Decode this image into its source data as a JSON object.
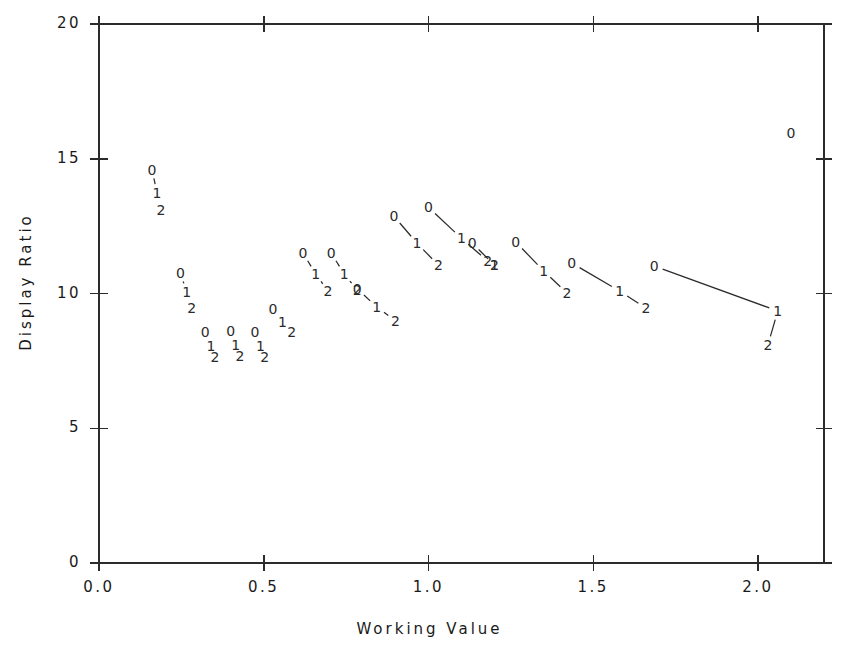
{
  "chart_data": {
    "type": "line",
    "title": "",
    "xlabel": "Working Value",
    "ylabel": "Display Ratio",
    "xlim": [
      0.0,
      2.2
    ],
    "ylim": [
      0,
      20
    ],
    "grid": false,
    "legend": "none",
    "point_labels": [
      "0",
      "1",
      "2"
    ],
    "xticks": [
      {
        "value": 0.0,
        "label": "0.0"
      },
      {
        "value": 0.5,
        "label": "0.5"
      },
      {
        "value": 1.0,
        "label": "1.0"
      },
      {
        "value": 1.5,
        "label": "1.5"
      },
      {
        "value": 2.0,
        "label": "2.0"
      }
    ],
    "yticks": [
      {
        "value": 0,
        "label": "0"
      },
      {
        "value": 5,
        "label": "5"
      },
      {
        "value": 10,
        "label": "10"
      },
      {
        "value": 15,
        "label": "15"
      },
      {
        "value": 20,
        "label": "20"
      }
    ],
    "series": [
      {
        "name": "group-1",
        "points": [
          {
            "label": "0",
            "x": 0.161,
            "y": 14.6
          },
          {
            "label": "1",
            "x": 0.176,
            "y": 13.73
          },
          {
            "label": "2",
            "x": 0.188,
            "y": 13.09
          }
        ]
      },
      {
        "name": "group-2",
        "points": [
          {
            "label": "0",
            "x": 0.247,
            "y": 10.76
          },
          {
            "label": "1",
            "x": 0.266,
            "y": 10.06
          },
          {
            "label": "2",
            "x": 0.281,
            "y": 9.46
          }
        ]
      },
      {
        "name": "group-3",
        "points": [
          {
            "label": "0",
            "x": 0.322,
            "y": 8.57
          },
          {
            "label": "1",
            "x": 0.34,
            "y": 8.05
          },
          {
            "label": "2",
            "x": 0.352,
            "y": 7.64
          }
        ]
      },
      {
        "name": "group-4",
        "points": [
          {
            "label": "0",
            "x": 0.4,
            "y": 8.61
          },
          {
            "label": "1",
            "x": 0.415,
            "y": 8.09
          },
          {
            "label": "2",
            "x": 0.428,
            "y": 7.68
          }
        ]
      },
      {
        "name": "group-5",
        "points": [
          {
            "label": "0",
            "x": 0.473,
            "y": 8.57
          },
          {
            "label": "1",
            "x": 0.49,
            "y": 8.05
          },
          {
            "label": "2",
            "x": 0.503,
            "y": 7.64
          }
        ]
      },
      {
        "name": "group-6",
        "points": [
          {
            "label": "0",
            "x": 0.528,
            "y": 9.42
          },
          {
            "label": "1",
            "x": 0.557,
            "y": 8.94
          },
          {
            "label": "2",
            "x": 0.585,
            "y": 8.57
          }
        ]
      },
      {
        "name": "group-7",
        "points": [
          {
            "label": "0",
            "x": 0.619,
            "y": 11.5
          },
          {
            "label": "1",
            "x": 0.658,
            "y": 10.72
          },
          {
            "label": "2",
            "x": 0.695,
            "y": 10.09
          }
        ]
      },
      {
        "name": "group-8",
        "points": [
          {
            "label": "0",
            "x": 0.705,
            "y": 11.5
          },
          {
            "label": "1",
            "x": 0.744,
            "y": 10.72
          },
          {
            "label": "2",
            "x": 0.784,
            "y": 10.13
          }
        ]
      },
      {
        "name": "group-9",
        "points": [
          {
            "label": "0",
            "x": 0.784,
            "y": 10.17
          },
          {
            "label": "1",
            "x": 0.843,
            "y": 9.5
          },
          {
            "label": "2",
            "x": 0.9,
            "y": 8.98
          }
        ]
      },
      {
        "name": "group-10",
        "points": [
          {
            "label": "0",
            "x": 0.895,
            "y": 12.87
          },
          {
            "label": "1",
            "x": 0.965,
            "y": 11.87
          },
          {
            "label": "2",
            "x": 1.03,
            "y": 11.05
          }
        ]
      },
      {
        "name": "group-11",
        "points": [
          {
            "label": "0",
            "x": 1.0,
            "y": 13.2
          },
          {
            "label": "1",
            "x": 1.1,
            "y": 12.05
          },
          {
            "label": "2",
            "x": 1.18,
            "y": 11.2
          }
        ]
      },
      {
        "name": "group-12",
        "points": [
          {
            "label": "0",
            "x": 1.133,
            "y": 11.87
          },
          {
            "label": "1",
            "x": 1.2,
            "y": 11.05
          },
          {
            "label": "2",
            "x": 1.2,
            "y": 11.05
          }
        ]
      },
      {
        "name": "group-13",
        "points": [
          {
            "label": "0",
            "x": 1.265,
            "y": 11.91
          },
          {
            "label": "1",
            "x": 1.35,
            "y": 10.83
          },
          {
            "label": "2",
            "x": 1.42,
            "y": 10.02
          }
        ]
      },
      {
        "name": "group-14",
        "points": [
          {
            "label": "0",
            "x": 1.435,
            "y": 11.13
          },
          {
            "label": "1",
            "x": 1.58,
            "y": 10.09
          },
          {
            "label": "2",
            "x": 1.66,
            "y": 9.46
          }
        ]
      },
      {
        "name": "group-15",
        "points": [
          {
            "label": "0",
            "x": 1.685,
            "y": 11.02
          },
          {
            "label": "1",
            "x": 2.06,
            "y": 9.35
          },
          {
            "label": "2",
            "x": 2.03,
            "y": 8.09
          }
        ]
      }
    ],
    "outlier_points": [
      {
        "label": "0",
        "x": 2.1,
        "y": 15.96
      }
    ]
  }
}
